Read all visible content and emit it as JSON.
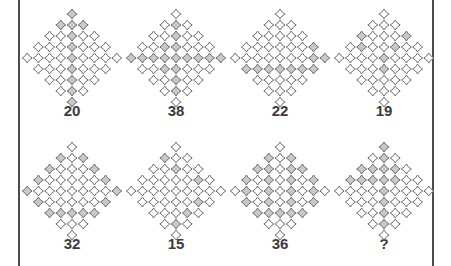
{
  "puzzle": {
    "type": "visual-sequence-puzzle",
    "grid": {
      "rows": 2,
      "columns": 4
    },
    "colors": {
      "cell_fill_shaded": "#c9c9c9",
      "cell_fill_empty": "#ffffff",
      "cell_stroke": "#6e6e73",
      "border": "#4a4a4f",
      "label_text": "#3a3a3f",
      "background": "#ffffff"
    },
    "lattice": {
      "description": "diamond-shaped lattice of small rounded diamond cells arranged on a rotated square grid",
      "rows_profile": [
        1,
        3,
        5,
        7,
        9,
        7,
        5,
        3,
        1
      ],
      "max_width": 9
    },
    "panels": [
      {
        "id": "panel-1",
        "label": "20",
        "shaded_count": 20,
        "pattern_name": "central-vertical-column",
        "rows": [
          {
            "count": 1,
            "shaded": [
              0
            ]
          },
          {
            "count": 3,
            "shaded": [
              0,
              1,
              2
            ]
          },
          {
            "count": 5,
            "shaded": [
              2
            ]
          },
          {
            "count": 7,
            "shaded": [
              3
            ]
          },
          {
            "count": 9,
            "shaded": [
              4
            ]
          },
          {
            "count": 7,
            "shaded": [
              3
            ]
          },
          {
            "count": 5,
            "shaded": [
              2
            ]
          },
          {
            "count": 3,
            "shaded": [
              1
            ]
          },
          {
            "count": 1,
            "shaded": [
              0
            ]
          }
        ]
      },
      {
        "id": "panel-2",
        "label": "38",
        "shaded_count": 38,
        "pattern_name": "cross-row-and-column",
        "rows": [
          {
            "count": 1,
            "shaded": []
          },
          {
            "count": 3,
            "shaded": [
              1
            ]
          },
          {
            "count": 5,
            "shaded": [
              2
            ]
          },
          {
            "count": 7,
            "shaded": [
              2,
              3
            ]
          },
          {
            "count": 9,
            "shaded": [
              0,
              1,
              2,
              3,
              4,
              5,
              6,
              7,
              8
            ]
          },
          {
            "count": 7,
            "shaded": [
              2,
              3
            ]
          },
          {
            "count": 5,
            "shaded": [
              2
            ]
          },
          {
            "count": 3,
            "shaded": [
              1
            ]
          },
          {
            "count": 1,
            "shaded": []
          }
        ]
      },
      {
        "id": "panel-3",
        "label": "22",
        "shaded_count": 22,
        "pattern_name": "lower-horizontal-row",
        "rows": [
          {
            "count": 1,
            "shaded": []
          },
          {
            "count": 3,
            "shaded": []
          },
          {
            "count": 5,
            "shaded": []
          },
          {
            "count": 7,
            "shaded": [
              6
            ]
          },
          {
            "count": 9,
            "shaded": [
              7,
              8
            ]
          },
          {
            "count": 7,
            "shaded": [
              0,
              1,
              2,
              3,
              4,
              5,
              6
            ]
          },
          {
            "count": 5,
            "shaded": []
          },
          {
            "count": 3,
            "shaded": []
          },
          {
            "count": 1,
            "shaded": []
          }
        ]
      },
      {
        "id": "panel-4",
        "label": "19",
        "shaded_count": 19,
        "pattern_name": "sparse-scattered",
        "rows": [
          {
            "count": 1,
            "shaded": []
          },
          {
            "count": 3,
            "shaded": []
          },
          {
            "count": 5,
            "shaded": [
              0,
              4
            ]
          },
          {
            "count": 7,
            "shaded": [
              1,
              4
            ]
          },
          {
            "count": 9,
            "shaded": [
              4
            ]
          },
          {
            "count": 7,
            "shaded": [
              3
            ]
          },
          {
            "count": 5,
            "shaded": []
          },
          {
            "count": 3,
            "shaded": []
          },
          {
            "count": 1,
            "shaded": []
          }
        ]
      },
      {
        "id": "panel-5",
        "label": "32",
        "shaded_count": 32,
        "pattern_name": "perimeter-ring",
        "rows": [
          {
            "count": 1,
            "shaded": []
          },
          {
            "count": 3,
            "shaded": [
              0,
              2
            ]
          },
          {
            "count": 5,
            "shaded": [
              0,
              4
            ]
          },
          {
            "count": 7,
            "shaded": [
              0,
              6
            ]
          },
          {
            "count": 9,
            "shaded": [
              0,
              8
            ]
          },
          {
            "count": 7,
            "shaded": [
              0,
              6
            ]
          },
          {
            "count": 5,
            "shaded": [
              0,
              1,
              2,
              3,
              4
            ]
          },
          {
            "count": 3,
            "shaded": []
          },
          {
            "count": 1,
            "shaded": []
          }
        ]
      },
      {
        "id": "panel-6",
        "label": "15",
        "shaded_count": 15,
        "pattern_name": "sparse-diagonal",
        "rows": [
          {
            "count": 1,
            "shaded": []
          },
          {
            "count": 3,
            "shaded": [
              0
            ]
          },
          {
            "count": 5,
            "shaded": [
              2
            ]
          },
          {
            "count": 7,
            "shaded": [
              5
            ]
          },
          {
            "count": 9,
            "shaded": []
          },
          {
            "count": 7,
            "shaded": [
              5
            ]
          },
          {
            "count": 5,
            "shaded": [
              3
            ]
          },
          {
            "count": 3,
            "shaded": [
              1
            ]
          },
          {
            "count": 1,
            "shaded": []
          }
        ]
      },
      {
        "id": "panel-7",
        "label": "36",
        "shaded_count": 36,
        "pattern_name": "dense-ring",
        "rows": [
          {
            "count": 1,
            "shaded": []
          },
          {
            "count": 3,
            "shaded": [
              0,
              2
            ]
          },
          {
            "count": 5,
            "shaded": [
              0,
              1,
              3,
              4
            ]
          },
          {
            "count": 7,
            "shaded": [
              0,
              2,
              4,
              6
            ]
          },
          {
            "count": 9,
            "shaded": [
              1,
              3,
              5,
              7
            ]
          },
          {
            "count": 7,
            "shaded": [
              0,
              2,
              4,
              6
            ]
          },
          {
            "count": 5,
            "shaded": [
              0,
              1,
              2,
              3,
              4
            ]
          },
          {
            "count": 3,
            "shaded": []
          },
          {
            "count": 1,
            "shaded": []
          }
        ]
      },
      {
        "id": "panel-8",
        "label": "?",
        "shaded_count": null,
        "pattern_name": "cross-plus",
        "rows": [
          {
            "count": 1,
            "shaded": [
              0
            ]
          },
          {
            "count": 3,
            "shaded": [
              1
            ]
          },
          {
            "count": 5,
            "shaded": [
              0,
              1,
              2,
              3
            ]
          },
          {
            "count": 7,
            "shaded": [
              0,
              1,
              2,
              3,
              4
            ]
          },
          {
            "count": 9,
            "shaded": [
              4
            ]
          },
          {
            "count": 7,
            "shaded": [
              3
            ]
          },
          {
            "count": 5,
            "shaded": [
              2
            ]
          },
          {
            "count": 3,
            "shaded": [
              1
            ]
          },
          {
            "count": 1,
            "shaded": []
          }
        ]
      }
    ]
  }
}
